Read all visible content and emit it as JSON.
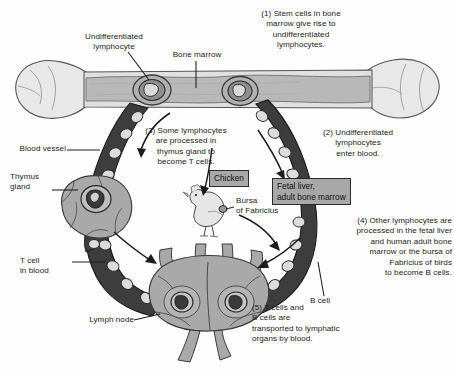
{
  "diagram": {
    "steps": {
      "step1": "(1) Stem cells in bone\nmarrow give rise to\nundifferentiated\nlymphocytes.",
      "step2": "(2) Undifferentiated\nlymphocytes\nenter blood.",
      "step3": "(3)  Some lymphocytes\nare processed in\nthymus gland to\nbecome T cells.",
      "step4": "(4) Other lymphocytes are\nprocessed in the fetal liver\nand human adult bone\nmarrow or the bursa of\nFabricius of birds\nto become B cells.",
      "step5": "(5) T cells and\nB cells are\ntransported to lymphatic\norgans by blood."
    },
    "labels": {
      "undifferentiated_lymphocyte": "Undifferentiated\nlymphocyte",
      "bone_marrow": "Bone marrow",
      "blood_vessel": "Blood vessel",
      "thymus_gland": "Thymus\ngland",
      "t_cell_in_blood": "T cell\nin blood",
      "lymph_node": "Lymph node",
      "b_cell": "B cell",
      "bursa_of_fabricius": "Bursa\nof Fabricius"
    },
    "callout_boxes": {
      "chicken": "Chicken",
      "fetal_liver": "Fetal liver,\nadult bone marrow"
    },
    "colors": {
      "bone_fill": "#e2e2e2",
      "marrow_fill": "#b6b6b6",
      "vessel_fill": "#3b3b3b",
      "cell_fill": "#d6d6d6",
      "organ_fill": "#a9a9a9",
      "box_fill": "#a8a8a8",
      "outline": "#2b2b2b",
      "text": "#1c1c1c"
    }
  }
}
